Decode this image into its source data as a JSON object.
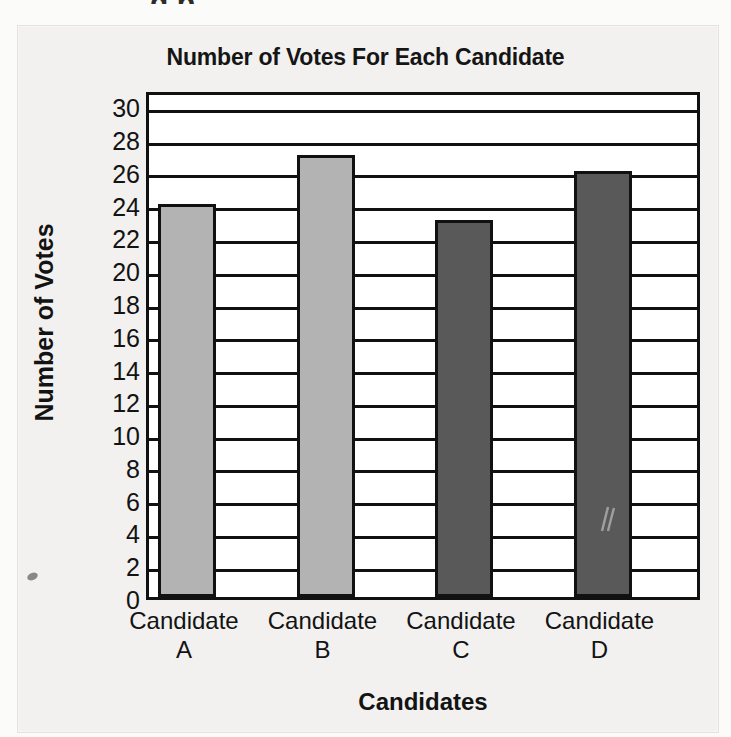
{
  "page": {
    "background_color": "#f2f1ef",
    "top_crop_fragment": "g p",
    "speck_artifact": "scan-speck"
  },
  "chart_data": {
    "type": "bar",
    "title": "Number of Votes For Each Candidate",
    "xlabel": "Candidates",
    "ylabel": "Number of Votes",
    "categories": [
      "Candidate A",
      "Candidate B",
      "Candidate C",
      "Candidate D"
    ],
    "category_lines": [
      [
        "Candidate",
        "A"
      ],
      [
        "Candidate",
        "B"
      ],
      [
        "Candidate",
        "C"
      ],
      [
        "Candidate",
        "D"
      ]
    ],
    "values": [
      24,
      27,
      23,
      26
    ],
    "bar_colors": [
      "#b3b3b3",
      "#b3b3b3",
      "#595959",
      "#595959"
    ],
    "bar_border_color": "#111111",
    "ylim": [
      0,
      31
    ],
    "ytick_step": 2,
    "ytick_labels": [
      "30",
      "28",
      "26",
      "24",
      "22",
      "20",
      "18",
      "16",
      "14",
      "12",
      "10",
      "8",
      "6",
      "4",
      "2",
      "0"
    ],
    "ytick_values": [
      30,
      28,
      26,
      24,
      22,
      20,
      18,
      16,
      14,
      12,
      10,
      8,
      6,
      4,
      2,
      0
    ],
    "grid": true,
    "grid_orientation": "horizontal",
    "legend": null,
    "annotations": [
      "scratch-mark-on-bar-d"
    ]
  }
}
